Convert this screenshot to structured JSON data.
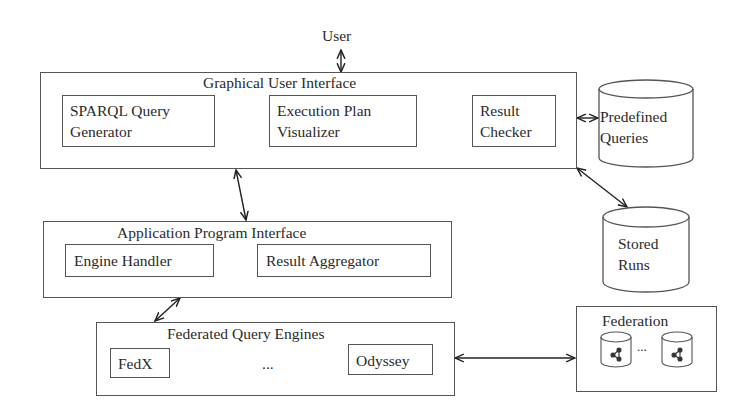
{
  "diagram": {
    "user": {
      "label": "User"
    },
    "gui": {
      "title": "Graphical User Interface",
      "components": [
        {
          "line1": "SPARQL Query",
          "line2": "Generator"
        },
        {
          "line1": "Execution Plan",
          "line2": "Visualizer"
        },
        {
          "line1": "Result",
          "line2": "Checker"
        }
      ]
    },
    "api": {
      "title": "Application Program Interface",
      "components": [
        {
          "label": "Engine Handler"
        },
        {
          "label": "Result Aggregator"
        }
      ]
    },
    "engines": {
      "title": "Federated Query Engines",
      "components": [
        {
          "label": "FedX"
        },
        {
          "label": "Odyssey"
        }
      ],
      "ellipsis": "..."
    },
    "stores": {
      "predefined": {
        "line1": "Predefined",
        "line2": "Queries"
      },
      "stored_runs": {
        "line1": "Stored",
        "line2": "Runs"
      }
    },
    "federation": {
      "title": "Federation",
      "ellipsis": "...",
      "endpoint_icon": "rdf-graph-database-icon"
    },
    "connections": [
      {
        "from": "User",
        "to": "Graphical User Interface",
        "type": "bidirectional"
      },
      {
        "from": "Graphical User Interface",
        "to": "Application Program Interface",
        "type": "bidirectional"
      },
      {
        "from": "Application Program Interface",
        "to": "Federated Query Engines",
        "type": "bidirectional"
      },
      {
        "from": "Graphical User Interface",
        "to": "Predefined Queries",
        "type": "bidirectional"
      },
      {
        "from": "Graphical User Interface",
        "to": "Stored Runs",
        "type": "bidirectional"
      },
      {
        "from": "Federated Query Engines",
        "to": "Federation",
        "type": "bidirectional"
      }
    ]
  }
}
